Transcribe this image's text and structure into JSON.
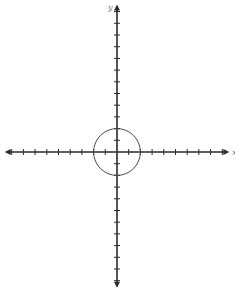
{
  "diagram": {
    "type": "coordinate-plane",
    "x_axis_label": "x",
    "y_axis_label": "y",
    "colors": {
      "axis": "#2b2b2b",
      "circle": "#4a4a4a",
      "label": "#6b6b6b",
      "background": "#ffffff"
    },
    "origin_px": [
      117,
      152
    ],
    "unit_px": 11.7,
    "x_ticks": {
      "negative": 9,
      "positive": 9
    },
    "y_ticks": {
      "positive": 12,
      "negative": 11
    },
    "circle": {
      "center": [
        0,
        0
      ],
      "radius": 2
    }
  }
}
